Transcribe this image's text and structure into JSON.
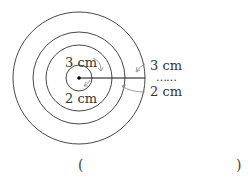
{
  "diagram": {
    "type": "concentric-circles",
    "center": {
      "x": 79,
      "y": 78
    },
    "radii_px": [
      13,
      33,
      46,
      66
    ],
    "labels": {
      "inner_top": "3 cm",
      "inner_bottom": "2 cm",
      "right_top": "3 cm",
      "right_dots": "……",
      "right_bottom": "2 cm"
    },
    "answer_blank": {
      "open": "(",
      "close": ")"
    }
  }
}
